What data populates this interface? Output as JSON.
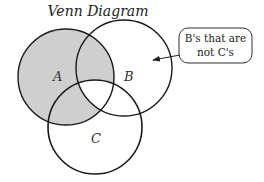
{
  "title": "Venn Diagram",
  "sets": [
    {
      "name": "A",
      "label": "A",
      "shaded": true
    },
    {
      "name": "B",
      "label": "B",
      "shaded": false
    },
    {
      "name": "C",
      "label": "C",
      "shaded": false
    }
  ],
  "shaded_region": "A minus (A∩B∩C)",
  "callout": {
    "line1": "B's that are",
    "line2": "not C's",
    "points_to": "B minus C"
  },
  "colors": {
    "shade": "#cfcfcf",
    "stroke": "#1a1a1a",
    "background": "#ffffff"
  }
}
